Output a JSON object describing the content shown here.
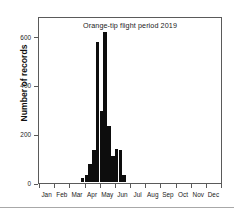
{
  "chart_data": {
    "type": "bar",
    "title": "Orange-tip flight period 2019",
    "xlabel": "",
    "ylabel": "Number of records",
    "ylim": [
      0,
      680
    ],
    "yticks": [
      0,
      200,
      400,
      600
    ],
    "ytick_labels": [
      "0",
      "200",
      "400",
      "600"
    ],
    "grid": false,
    "legend": null,
    "xaxis_type": "month",
    "xtick_labels": [
      "Jan",
      "Feb",
      "Mar",
      "Apr",
      "May",
      "Jun",
      "Jul",
      "Aug",
      "Sep",
      "Oct",
      "Nov",
      "Dec"
    ],
    "bar_color": "#0d0d0d",
    "bin_description": "weekly bins across the year",
    "x": [
      "Jan w1",
      "Jan w2",
      "Jan w3",
      "Jan w4",
      "Feb w1",
      "Feb w2",
      "Feb w3",
      "Feb w4",
      "Mar w1",
      "Mar w2",
      "Mar w3",
      "Mar w4",
      "Apr w1",
      "Apr w2",
      "Apr w3",
      "Apr w4",
      "May w1",
      "May w2",
      "May w3",
      "May w4",
      "Jun w1",
      "Jun w2",
      "Jun w3",
      "Jun w4",
      "Jul w1",
      "Jul w2",
      "Jul w3",
      "Jul w4",
      "Aug w1",
      "Aug w2",
      "Aug w3",
      "Aug w4",
      "Sep w1",
      "Sep w2",
      "Sep w3",
      "Sep w4",
      "Oct w1",
      "Oct w2",
      "Oct w3",
      "Oct w4",
      "Nov w1",
      "Nov w2",
      "Nov w3",
      "Nov w4",
      "Dec w1",
      "Dec w2",
      "Dec w3",
      "Dec w4"
    ],
    "values": [
      0,
      0,
      0,
      0,
      0,
      0,
      0,
      0,
      0,
      0,
      0,
      18,
      30,
      75,
      130,
      575,
      290,
      615,
      230,
      105,
      135,
      130,
      30,
      0,
      0,
      0,
      0,
      0,
      0,
      0,
      0,
      0,
      0,
      0,
      0,
      0,
      0,
      0,
      0,
      0,
      0,
      0,
      0,
      0,
      0,
      0,
      0,
      0
    ],
    "peaks": [
      {
        "label": "Apr w4",
        "value": 575
      },
      {
        "label": "May w2",
        "value": 615
      }
    ]
  }
}
